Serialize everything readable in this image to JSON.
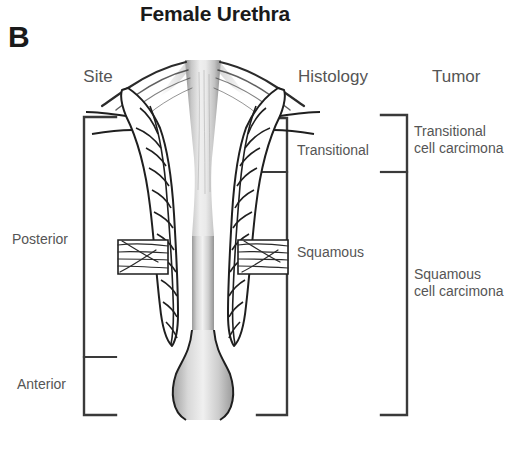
{
  "figure": {
    "panel_label": "B",
    "title": "Female Urethra",
    "background_color": "#ffffff",
    "line_color": "#3a3a3a",
    "text_color": "#555555"
  },
  "columns": {
    "site": {
      "header": "Site"
    },
    "histology": {
      "header": "Histology"
    },
    "tumor": {
      "header": "Tumor"
    }
  },
  "site_regions": [
    {
      "label": "Posterior"
    },
    {
      "label": "Anterior"
    }
  ],
  "histology_regions": [
    {
      "label": "Transitional"
    },
    {
      "label": "Squamous"
    }
  ],
  "tumor_regions": [
    {
      "line1": "Transitional",
      "line2": "cell carcimona"
    },
    {
      "line1": "Squamous",
      "line2": "cell carcimona"
    }
  ],
  "brackets": {
    "site": {
      "orientation": "opens-right",
      "top": 117,
      "bottom": 415,
      "divider": 357,
      "spine_x": 84,
      "arm_length": 32
    },
    "histology": {
      "orientation": "opens-left",
      "top": 118,
      "bottom": 415,
      "divider": 172,
      "spine_x": 287,
      "arm_length": 30
    },
    "tumor": {
      "orientation": "opens-left",
      "top": 115,
      "bottom": 415,
      "divider": 172,
      "spine_x": 407,
      "arm_length": 26
    }
  },
  "anatomy": {
    "name": "female-urethra-cross-section",
    "features": [
      "splayed-fibers-top",
      "funnel-lumen",
      "cobblestone-epithelium-left",
      "cobblestone-epithelium-right",
      "sphincter-muscle-band-left",
      "sphincter-muscle-band-right",
      "bulbous-distal-urethra"
    ]
  }
}
